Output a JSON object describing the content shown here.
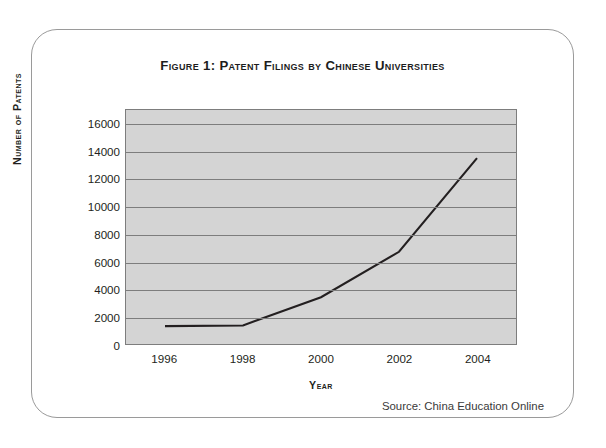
{
  "figure": {
    "title": "Figure 1: Patent Filings by Chinese Universities",
    "source": "Source: China Education Online"
  },
  "chart_data": {
    "type": "line",
    "title": "Figure 1: Patent Filings by Chinese Universities",
    "xlabel": "Year",
    "ylabel": "Number of Patents",
    "xlim": [
      1995,
      2005
    ],
    "ylim": [
      0,
      17000
    ],
    "grid": true,
    "legend": "none",
    "plot_background": "#d4d4d4",
    "line_color": "#231f20",
    "x_tick_labels": [
      "1996",
      "1998",
      "2000",
      "2002",
      "2004"
    ],
    "x_ticks": [
      1996,
      1998,
      2000,
      2002,
      2004
    ],
    "y_tick_labels": [
      "0",
      "2000",
      "4000",
      "6000",
      "8000",
      "10000",
      "12000",
      "14000",
      "16000"
    ],
    "y_ticks": [
      0,
      2000,
      4000,
      6000,
      8000,
      10000,
      12000,
      14000,
      16000
    ],
    "series": [
      {
        "name": "Patent filings",
        "x": [
          1996,
          1998,
          2000,
          2002,
          2004
        ],
        "values": [
          1300,
          1350,
          3400,
          6700,
          13500
        ]
      }
    ]
  }
}
